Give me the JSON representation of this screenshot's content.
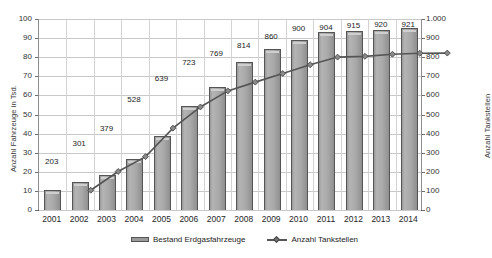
{
  "chart_data": {
    "type": "bar",
    "title": "",
    "subtitle": "",
    "categories": [
      "2001",
      "2002",
      "2003",
      "2004",
      "2005",
      "2006",
      "2007",
      "2008",
      "2009",
      "2010",
      "2011",
      "2012",
      "2013",
      "2014"
    ],
    "series": [
      {
        "name": "Bestand Erdgasfahrzeuge",
        "type": "bar",
        "axis": "left",
        "unit": "Tsd.",
        "values": [
          10.5,
          14.5,
          18.5,
          26.5,
          38.5,
          54.5,
          64.5,
          77.5,
          84.5,
          89.0,
          93.0,
          93.5,
          94.5,
          95.5
        ]
      },
      {
        "name": "Anzahl Tankstellen",
        "type": "line",
        "axis": "right",
        "unit": "",
        "values": [
          203,
          301,
          379,
          528,
          639,
          723,
          769,
          814,
          860,
          900,
          904,
          915,
          920,
          921
        ],
        "labels": [
          "203",
          "301",
          "379",
          "528",
          "639",
          "723",
          "769",
          "814",
          "860",
          "900",
          "904",
          "915",
          "920",
          "921"
        ]
      }
    ],
    "xlabel": "",
    "ylabel": "Anzahl Fahrzeuge in Tsd.",
    "ylabel_right": "Anzahl Tankstellen",
    "ylim": [
      0,
      100
    ],
    "ylim_right": [
      0,
      1000
    ],
    "yticks": [
      "0",
      "10",
      "20",
      "30",
      "40",
      "50",
      "60",
      "70",
      "80",
      "90",
      "100"
    ],
    "yticks_right": [
      "0",
      "100",
      "200",
      "300",
      "400",
      "500",
      "600",
      "700",
      "800",
      "900",
      "1.000"
    ],
    "grid": true,
    "legend_position": "bottom",
    "colors": {
      "bar_fill": "#a8a8a8",
      "bar_edge": "#555555",
      "line": "#555555",
      "grid": "#c9c9c9",
      "text": "#1d1d1d"
    }
  },
  "legend": {
    "items": [
      {
        "label": "Bestand Erdgasfahrzeuge",
        "icon": "bar-swatch"
      },
      {
        "label": "Anzahl Tankstellen",
        "icon": "line-marker-swatch"
      }
    ]
  }
}
